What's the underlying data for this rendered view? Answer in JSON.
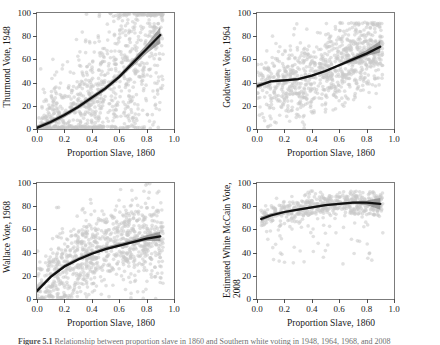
{
  "figure": {
    "background": "#ffffff",
    "point_color": "#c9c9c9",
    "line_color": "#111111",
    "band_color": "#8a8a8a",
    "frame_color": "#7b7b7b",
    "caption_label": "Figure 5.1",
    "caption_text": "Relationship between proportion slave in 1860 and Southern white voting in 1948, 1964, 1968, and 2008"
  },
  "axis": {
    "x_label": "Proportion Slave, 1860",
    "x_ticks": [
      "0.0",
      "0.2",
      "0.4",
      "0.6",
      "0.8",
      "1.0"
    ],
    "x_tick_values": [
      0.0,
      0.2,
      0.4,
      0.6,
      0.8,
      1.0
    ],
    "y_ticks": [
      "0",
      "20",
      "40",
      "60",
      "80",
      "100"
    ],
    "y_tick_values": [
      0,
      20,
      40,
      60,
      80,
      100
    ]
  },
  "panels": {
    "p1": {
      "y_label": "Thurmond Vote, 1948"
    },
    "p2": {
      "y_label": "Goldwater Vote, 1964"
    },
    "p3": {
      "y_label": "Wallace Vote, 1968"
    },
    "p4": {
      "y_label_line1": "Estimated White McCain Vote,",
      "y_label_line2": "2008"
    }
  },
  "chart_data": [
    {
      "type": "scatter",
      "title": "",
      "xlabel": "Proportion Slave, 1860",
      "ylabel": "Thurmond Vote, 1948",
      "xlim": [
        0.0,
        1.0
      ],
      "ylim": [
        0,
        100
      ],
      "grid": false,
      "legend": "none",
      "series": [
        {
          "name": "Counties",
          "marker": "circle",
          "color": "#c9c9c9",
          "alpha": 0.5,
          "n_points": 900,
          "x_range": [
            0.0,
            0.92
          ],
          "y_range": [
            0,
            100
          ],
          "description": "Dense cloud of Southern counties; strong positive spread, heavy mass near y=0-30 for low x, broad scatter 0-100 across mid x."
        },
        {
          "name": "LOESS fit",
          "type": "line",
          "color": "#111111",
          "x": [
            0.0,
            0.1,
            0.2,
            0.3,
            0.4,
            0.5,
            0.6,
            0.7,
            0.8,
            0.9
          ],
          "y": [
            1,
            6,
            12,
            19,
            27,
            35,
            45,
            57,
            69,
            81
          ],
          "band": {
            "color": "#8a8a8a",
            "lower": [
              0,
              4,
              10,
              17,
              25,
              33,
              43,
              54,
              65,
              74
            ],
            "upper": [
              3,
              8,
              14,
              21,
              29,
              37,
              47,
              60,
              73,
              88
            ]
          }
        }
      ]
    },
    {
      "type": "scatter",
      "title": "",
      "xlabel": "Proportion Slave, 1860",
      "ylabel": "Goldwater Vote, 1964",
      "xlim": [
        0.0,
        1.0
      ],
      "ylim": [
        0,
        100
      ],
      "grid": false,
      "legend": "none",
      "series": [
        {
          "name": "Counties",
          "marker": "circle",
          "color": "#c9c9c9",
          "alpha": 0.5,
          "n_points": 900,
          "x_range": [
            0.0,
            0.92
          ],
          "y_range": [
            0,
            92
          ],
          "description": "Broad cloud centered around y=40-60, widening slightly upward with x."
        },
        {
          "name": "LOESS fit",
          "type": "line",
          "color": "#111111",
          "x": [
            0.0,
            0.1,
            0.2,
            0.3,
            0.4,
            0.5,
            0.6,
            0.7,
            0.8,
            0.9
          ],
          "y": [
            37,
            41,
            42,
            43,
            46,
            50,
            55,
            60,
            65,
            71
          ],
          "band": {
            "color": "#8a8a8a",
            "lower": [
              35,
              40,
              41,
              42,
              45,
              49,
              54,
              58,
              63,
              66
            ],
            "upper": [
              39,
              42,
              43,
              44,
              47,
              51,
              56,
              62,
              68,
              76
            ]
          }
        }
      ]
    },
    {
      "type": "scatter",
      "title": "",
      "xlabel": "Proportion Slave, 1860",
      "ylabel": "Wallace Vote, 1968",
      "xlim": [
        0.0,
        1.0
      ],
      "ylim": [
        0,
        100
      ],
      "grid": false,
      "legend": "none",
      "series": [
        {
          "name": "Counties",
          "marker": "circle",
          "color": "#c9c9c9",
          "alpha": 0.5,
          "n_points": 900,
          "x_range": [
            0.0,
            0.92
          ],
          "y_range": [
            0,
            100
          ],
          "description": "Dense cloud rising from near 0 at low x, centered around 35-50 at mid/high x."
        },
        {
          "name": "LOESS fit",
          "type": "line",
          "color": "#111111",
          "x": [
            0.0,
            0.1,
            0.2,
            0.3,
            0.4,
            0.5,
            0.6,
            0.7,
            0.8,
            0.9
          ],
          "y": [
            7,
            19,
            28,
            34,
            39,
            43,
            46,
            49,
            52,
            54
          ],
          "band": {
            "color": "#8a8a8a",
            "lower": [
              5,
              18,
              27,
              33,
              38,
              42,
              45,
              48,
              50,
              50
            ],
            "upper": [
              9,
              21,
              30,
              36,
              41,
              45,
              48,
              51,
              55,
              58
            ]
          }
        }
      ]
    },
    {
      "type": "scatter",
      "title": "",
      "xlabel": "Proportion Slave, 1860",
      "ylabel": "Estimated White McCain Vote, 2008",
      "xlim": [
        0.0,
        1.0
      ],
      "ylim": [
        0,
        100
      ],
      "grid": false,
      "legend": "none",
      "series": [
        {
          "name": "Counties",
          "marker": "circle",
          "color": "#c9c9c9",
          "alpha": 0.5,
          "n_points": 550,
          "x_range": [
            0.03,
            0.92
          ],
          "y_range": [
            30,
            93
          ],
          "description": "Tight cloud concentrated between y=65 and y=90, with a thin tail of outliers down to y=30 at low-to-mid x."
        },
        {
          "name": "LOESS fit",
          "type": "line",
          "color": "#111111",
          "x": [
            0.03,
            0.1,
            0.2,
            0.3,
            0.4,
            0.5,
            0.6,
            0.7,
            0.8,
            0.9
          ],
          "y": [
            69,
            72,
            75,
            77,
            79,
            81,
            82,
            83,
            83,
            82
          ],
          "band": {
            "color": "#8a8a8a",
            "lower": [
              67,
              71,
              74,
              76,
              78,
              80,
              81,
              82,
              81,
              77
            ],
            "upper": [
              71,
              74,
              76,
              78,
              80,
              82,
              83,
              84,
              85,
              87
            ]
          }
        }
      ]
    }
  ]
}
